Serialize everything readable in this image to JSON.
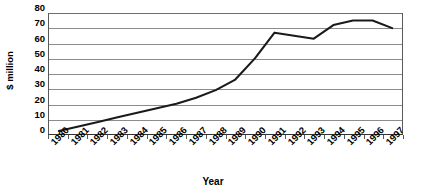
{
  "chart_data": {
    "type": "line",
    "title": "",
    "xlabel": "Year",
    "ylabel": "$ million",
    "categories": [
      "1980",
      "1981",
      "1982",
      "1983",
      "1984",
      "1985",
      "1986",
      "1987",
      "1988",
      "1989",
      "1990",
      "1991",
      "1992",
      "1993",
      "1994",
      "1995",
      "1996",
      "1997"
    ],
    "values": [
      2,
      5,
      8,
      11,
      14,
      17,
      20,
      24,
      29,
      36,
      50,
      67,
      65,
      63,
      72,
      75,
      75,
      70
    ],
    "series": [
      {
        "name": "$ million",
        "values": [
          2,
          5,
          8,
          11,
          14,
          17,
          20,
          24,
          29,
          36,
          50,
          67,
          65,
          63,
          72,
          75,
          75,
          70
        ]
      }
    ],
    "ylim": [
      0,
      80
    ],
    "ytick_values": [
      0,
      10,
      20,
      30,
      40,
      50,
      60,
      70,
      80
    ],
    "ytick_labels": [
      "0",
      "10",
      "20",
      "30",
      "40",
      "50",
      "60",
      "70",
      "80"
    ],
    "grid": true,
    "grid_axis": "y",
    "legend": false,
    "legend_position": "none",
    "line_color": "#1a1a1a",
    "grid_color": "#8c8c8c",
    "axis_color": "#4d4d4d",
    "background_color": "#ffffff",
    "markers": false,
    "xtick_rotation": -45
  },
  "axes": {
    "y_title": "$ million",
    "x_title": "Year"
  }
}
